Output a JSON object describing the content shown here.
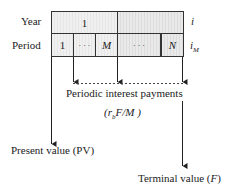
{
  "diagram": {
    "rows": {
      "year": {
        "label": "Year",
        "rate": "i",
        "cells": [
          "1",
          ""
        ]
      },
      "period": {
        "label": "Period",
        "rate": "i",
        "rate_sub": "M",
        "cells": [
          "1",
          "· · ·",
          "M",
          "· · ·",
          "N"
        ]
      }
    },
    "payments": {
      "label": "Periodic interest payments",
      "formula_prefix": "(r",
      "formula_sub": "b",
      "formula_suffix": "F/M )"
    },
    "present_value": {
      "label": "Present value (PV)"
    },
    "terminal_value": {
      "label_prefix": "Terminal value (",
      "label_var": "F",
      "label_suffix": ")"
    }
  }
}
